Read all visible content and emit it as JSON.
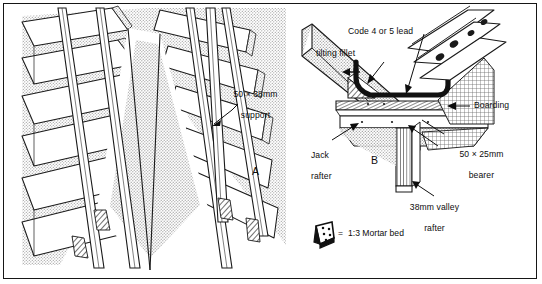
{
  "figure": {
    "border_color": "#161616",
    "background": "#ffffff"
  },
  "panel_a": {
    "name": "isometric-valley-view",
    "marker": "A",
    "annotations": [
      {
        "id": "support",
        "text": "50 × 38mm\nsupport",
        "line1": "50 × 38mm",
        "line2": "support",
        "leader": "arrow-down-left"
      }
    ]
  },
  "panel_b": {
    "name": "valley-section-detail",
    "marker": "B",
    "annotations": [
      {
        "id": "lead",
        "text": "Code 4 or 5 lead"
      },
      {
        "id": "tilting-fillet",
        "text": "tilting fillet"
      },
      {
        "id": "boarding",
        "text": "Boarding"
      },
      {
        "id": "jack-rafter",
        "line1": "Jack",
        "line2": "rafter"
      },
      {
        "id": "bearer",
        "line1": "50 × 25mm",
        "line2": "bearer"
      },
      {
        "id": "valley-rafter",
        "line1": "38mm valley",
        "line2": "rafter"
      }
    ],
    "legend": {
      "symbol": "mortar-bed-swatch",
      "equals": "=",
      "text": "1:3 Mortar bed"
    }
  },
  "colors": {
    "ink": "#0d0d0d",
    "line": "#1a1a1a",
    "stipple": "#b9b9b9",
    "hatch": "#6f6f6f",
    "lead": "#111111",
    "paper": "#ffffff"
  }
}
